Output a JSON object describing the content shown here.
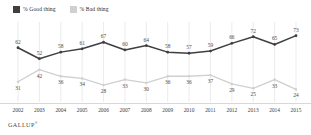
{
  "legend": {
    "position": "top-left",
    "items": [
      {
        "label": "% Good thing",
        "color": "#3f3f3f",
        "swatch": "legend-swatch-good"
      },
      {
        "label": "% Bad thing",
        "color": "#d0d0d0",
        "swatch": "legend-swatch-bad"
      }
    ]
  },
  "footer": {
    "brand": "GALLUP",
    "trademark": "®"
  },
  "chart_data": {
    "type": "line",
    "title": "",
    "subtitle": "",
    "xlabel": "",
    "ylabel": "",
    "grid": "vertical",
    "ylim": [
      0,
      100
    ],
    "categories": [
      "2002",
      "2003",
      "2004",
      "2005",
      "2006",
      "2007",
      "2008",
      "2009",
      "2010",
      "2011",
      "2012",
      "2013",
      "2014",
      "2015"
    ],
    "series": [
      {
        "name": "% Good thing",
        "color": "#3f3f3f",
        "values": [
          62,
          52,
          58,
          61,
          67,
          60,
          64,
          58,
          57,
          59,
          66,
          72,
          65,
          73
        ]
      },
      {
        "name": "% Bad thing",
        "color": "#d0d0d0",
        "values": [
          31,
          42,
          36,
          34,
          28,
          33,
          30,
          36,
          36,
          37,
          29,
          25,
          33,
          24
        ]
      }
    ],
    "colors": {
      "good": "#3f3f3f",
      "bad": "#d0d0d0",
      "grid": "#e2e2e2",
      "axis": "#d8d8d8",
      "text": "#3d3d3d"
    }
  }
}
